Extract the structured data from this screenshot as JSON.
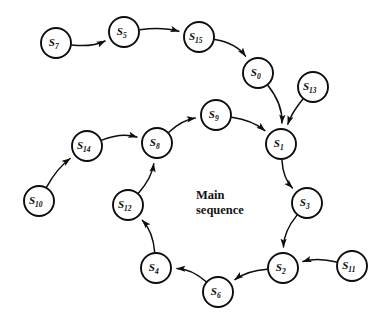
{
  "diagram": {
    "title_label": {
      "line1": "Main",
      "line2": "sequence",
      "x": 196,
      "y": 188
    },
    "node_radius": 15,
    "stroke_color": "#0d0d0d",
    "background_color": "#ffffff",
    "nodes": [
      {
        "id": "S7",
        "base": "S",
        "sub": "7",
        "x": 56,
        "y": 43
      },
      {
        "id": "S5",
        "base": "S",
        "sub": "5",
        "x": 124,
        "y": 32
      },
      {
        "id": "S15",
        "base": "S",
        "sub": "15",
        "x": 199,
        "y": 37
      },
      {
        "id": "S0",
        "base": "S",
        "sub": "0",
        "x": 258,
        "y": 73
      },
      {
        "id": "S13",
        "base": "S",
        "sub": "13",
        "x": 313,
        "y": 87
      },
      {
        "id": "S9",
        "base": "S",
        "sub": "9",
        "x": 216,
        "y": 115
      },
      {
        "id": "S1",
        "base": "S",
        "sub": "1",
        "x": 281,
        "y": 144
      },
      {
        "id": "S8",
        "base": "S",
        "sub": "8",
        "x": 157,
        "y": 143
      },
      {
        "id": "S14",
        "base": "S",
        "sub": "14",
        "x": 87,
        "y": 146
      },
      {
        "id": "S10",
        "base": "S",
        "sub": "10",
        "x": 39,
        "y": 201
      },
      {
        "id": "S12",
        "base": "S",
        "sub": "12",
        "x": 128,
        "y": 205
      },
      {
        "id": "S3",
        "base": "S",
        "sub": "3",
        "x": 307,
        "y": 203
      },
      {
        "id": "S4",
        "base": "S",
        "sub": "4",
        "x": 156,
        "y": 268
      },
      {
        "id": "S2",
        "base": "S",
        "sub": "2",
        "x": 283,
        "y": 268
      },
      {
        "id": "S11",
        "base": "S",
        "sub": "11",
        "x": 352,
        "y": 266
      },
      {
        "id": "S6",
        "base": "S",
        "sub": "6",
        "x": 218,
        "y": 292
      }
    ],
    "edges": [
      {
        "from": "S7",
        "to": "S5",
        "label": "S7-to-S5",
        "curve": 10
      },
      {
        "from": "S5",
        "to": "S15",
        "label": "S5-to-S15",
        "curve": -8
      },
      {
        "from": "S15",
        "to": "S0",
        "label": "S15-to-S0",
        "curve": -14
      },
      {
        "from": "S0",
        "to": "S1",
        "label": "S0-to-S1",
        "curve": -14
      },
      {
        "from": "S13",
        "to": "S1",
        "label": "S13-to-S1",
        "curve": 6
      },
      {
        "from": "S9",
        "to": "S1",
        "label": "S9-to-S1",
        "curve": -10
      },
      {
        "from": "S8",
        "to": "S9",
        "label": "S8-to-S9",
        "curve": -10
      },
      {
        "from": "S14",
        "to": "S8",
        "label": "S14-to-S8",
        "curve": -12
      },
      {
        "from": "S10",
        "to": "S14",
        "label": "S10-to-S14",
        "curve": -8
      },
      {
        "from": "S12",
        "to": "S8",
        "label": "S12-to-S8",
        "curve": 10
      },
      {
        "from": "S4",
        "to": "S12",
        "label": "S4-to-S12",
        "curve": 12
      },
      {
        "from": "S6",
        "to": "S4",
        "label": "S6-to-S4",
        "curve": 12
      },
      {
        "from": "S2",
        "to": "S6",
        "label": "S2-to-S6",
        "curve": 10
      },
      {
        "from": "S11",
        "to": "S2",
        "label": "S11-to-S2",
        "curve": 10
      },
      {
        "from": "S3",
        "to": "S2",
        "label": "S3-to-S2",
        "curve": 12
      },
      {
        "from": "S1",
        "to": "S3",
        "label": "S1-to-S3",
        "curve": 12
      }
    ]
  }
}
